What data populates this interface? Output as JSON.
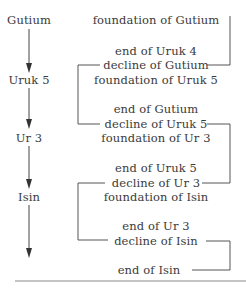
{
  "diagram": {
    "type": "chronology-flow",
    "colors": {
      "text": "#3a3a3a",
      "line": "#555555",
      "rule": "#888888",
      "background": "#ffffff"
    },
    "dynasties": [
      {
        "label": "Gutium"
      },
      {
        "label": "Uruk 5"
      },
      {
        "label": "Ur 3"
      },
      {
        "label": "Isin"
      }
    ],
    "events": [
      {
        "label": "foundation of Gutium"
      },
      {
        "label": "end of Uruk 4"
      },
      {
        "label": "decline of Gutium"
      },
      {
        "label": "foundation of Uruk 5"
      },
      {
        "label": "end of Gutium"
      },
      {
        "label": "decline of Uruk 5"
      },
      {
        "label": "foundation of Ur 3"
      },
      {
        "label": "end of Uruk 5"
      },
      {
        "label": "decline of Ur 3"
      },
      {
        "label": "foundation of Isin"
      },
      {
        "label": "end of Ur 3"
      },
      {
        "label": "decline of Isin"
      },
      {
        "label": "end of Isin"
      }
    ]
  }
}
